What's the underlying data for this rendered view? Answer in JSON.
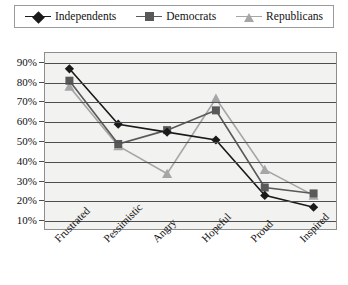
{
  "legend": {
    "position": "top",
    "entries": [
      {
        "label": "Independents",
        "marker": "diamond-marker",
        "color": "#1a1a1a"
      },
      {
        "label": "Democrats",
        "marker": "square-marker",
        "color": "#595959"
      },
      {
        "label": "Republicans",
        "marker": "triangle-marker",
        "color": "#a6a6a6"
      }
    ]
  },
  "chart_data": {
    "type": "line",
    "title": "",
    "xlabel": "",
    "ylabel": "",
    "categories": [
      "Frustrated",
      "Pessimistic",
      "Angry",
      "Hopeful",
      "Proud",
      "Inspired"
    ],
    "series": [
      {
        "name": "Independents",
        "color": "#1a1a1a",
        "marker": "diamond",
        "values": [
          87,
          59,
          55,
          51,
          23,
          17
        ]
      },
      {
        "name": "Democrats",
        "color": "#595959",
        "marker": "square",
        "values": [
          81,
          49,
          56,
          66,
          27,
          24
        ]
      },
      {
        "name": "Republicans",
        "color": "#a6a6a6",
        "marker": "triangle",
        "values": [
          78,
          48,
          34,
          72,
          36,
          23
        ]
      }
    ],
    "ylim": [
      5,
      95
    ],
    "yticks": [
      10,
      20,
      30,
      40,
      50,
      60,
      70,
      80,
      90
    ],
    "ytick_labels": [
      "10%",
      "20%",
      "30%",
      "40%",
      "50%",
      "60%",
      "70%",
      "80%",
      "90%"
    ],
    "grid": true,
    "legend_position": "top"
  },
  "colors": {
    "plot_background": "#f2f2f0",
    "gridline": "#4d4d4d",
    "frame": "#8d8d8d",
    "page_background": "#ffffff"
  }
}
